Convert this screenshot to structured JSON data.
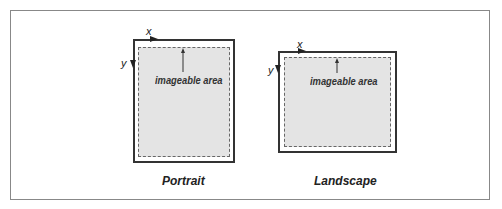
{
  "diagrams": [
    {
      "caption": "Portrait",
      "area_label": "imageable area",
      "x_label": "x",
      "y_label": "y"
    },
    {
      "caption": "Landscape",
      "area_label": "imageable area",
      "x_label": "x",
      "y_label": "y"
    }
  ]
}
